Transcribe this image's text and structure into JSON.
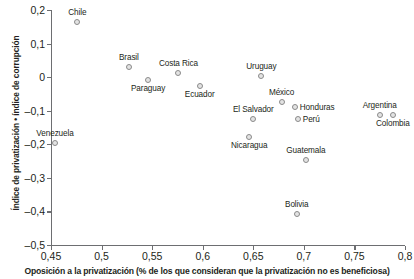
{
  "chart_data": {
    "type": "scatter",
    "title": "",
    "xlabel": "Oposición a la privatización (% de los que consideran que la privatización no es beneficiosa)",
    "ylabel": "Índice de privatización • índice de corrupción",
    "xlim": [
      0.45,
      0.8
    ],
    "ylim": [
      -0.5,
      0.2
    ],
    "grid": false,
    "legend": "none",
    "xticks": [
      "0,45",
      "0,5",
      "0,55",
      "0,6",
      "0,65",
      "0,7",
      "0,75",
      "0,8"
    ],
    "xtick_values": [
      0.45,
      0.5,
      0.55,
      0.6,
      0.65,
      0.7,
      0.75,
      0.8
    ],
    "yticks": [
      "0,2",
      "0,1",
      "0",
      "-0,1",
      "-0,2",
      "-0,3",
      "-0,4",
      "-0,5"
    ],
    "ytick_values": [
      0.2,
      0.1,
      0,
      -0.1,
      -0.2,
      -0.3,
      -0.4,
      -0.5
    ],
    "points": [
      {
        "label": "Chile",
        "x": 0.476,
        "y": 0.165,
        "label_pos": "above"
      },
      {
        "label": "Brasil",
        "x": 0.527,
        "y": 0.029,
        "label_pos": "above"
      },
      {
        "label": "Costa Rica",
        "x": 0.576,
        "y": 0.013,
        "label_pos": "above"
      },
      {
        "label": "Paraguay",
        "x": 0.546,
        "y": -0.008,
        "label_pos": "below"
      },
      {
        "label": "Ecuador",
        "x": 0.597,
        "y": -0.026,
        "label_pos": "below"
      },
      {
        "label": "Uruguay",
        "x": 0.658,
        "y": 0.002,
        "label_pos": "above"
      },
      {
        "label": "México",
        "x": 0.678,
        "y": -0.075,
        "label_pos": "above"
      },
      {
        "label": "Honduras",
        "x": 0.691,
        "y": -0.089,
        "label_pos": "right"
      },
      {
        "label": "El Salvador",
        "x": 0.65,
        "y": -0.124,
        "label_pos": "above"
      },
      {
        "label": "Perú",
        "x": 0.694,
        "y": -0.124,
        "label_pos": "right"
      },
      {
        "label": "Argentina",
        "x": 0.775,
        "y": -0.113,
        "label_pos": "above"
      },
      {
        "label": "Colombia",
        "x": 0.788,
        "y": -0.113,
        "label_pos": "below"
      },
      {
        "label": "Venezuela",
        "x": 0.454,
        "y": -0.197,
        "label_pos": "above"
      },
      {
        "label": "Nicaragua",
        "x": 0.646,
        "y": -0.177,
        "label_pos": "below"
      },
      {
        "label": "Guatemala",
        "x": 0.702,
        "y": -0.247,
        "label_pos": "above"
      },
      {
        "label": "Bolivia",
        "x": 0.693,
        "y": -0.407,
        "label_pos": "above"
      }
    ],
    "colors": {
      "marker_fill": "#e3e3e3",
      "marker_stroke": "#8a8a8a",
      "axis": "#6d6e71",
      "text": "#231f20",
      "background": "#ffffff"
    }
  }
}
